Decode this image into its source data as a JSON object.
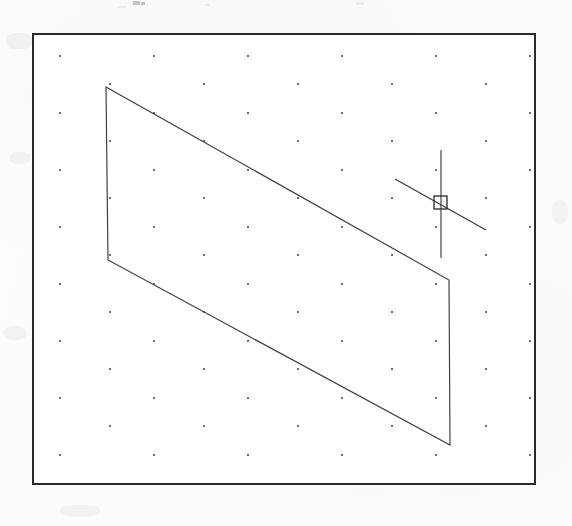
{
  "document": {
    "kind": "scanned-figure",
    "medium": "printed page scan",
    "paper_color": "#fdfdfb",
    "width": 572,
    "height": 526
  },
  "artifacts": {
    "description": "faint remnants of cropped text at the top edge of the scan",
    "marks": [
      {
        "x": 133,
        "y": 1,
        "w": 7,
        "h": 4,
        "soft": false
      },
      {
        "x": 141,
        "y": 2,
        "w": 4,
        "h": 3,
        "soft": false
      },
      {
        "x": 356,
        "y": 2,
        "w": 8,
        "h": 3,
        "soft": true
      },
      {
        "x": 117,
        "y": 6,
        "w": 10,
        "h": 2,
        "soft": true
      },
      {
        "x": 205,
        "y": 4,
        "w": 5,
        "h": 2,
        "soft": true
      }
    ],
    "smudges": [
      {
        "x": 6,
        "y": 33,
        "w": 26,
        "h": 16
      },
      {
        "x": 10,
        "y": 152,
        "w": 20,
        "h": 12
      },
      {
        "x": 4,
        "y": 326,
        "w": 22,
        "h": 14
      },
      {
        "x": 44,
        "y": 62,
        "w": 18,
        "h": 20
      },
      {
        "x": 552,
        "y": 200,
        "w": 16,
        "h": 24
      },
      {
        "x": 60,
        "y": 505,
        "w": 40,
        "h": 12
      }
    ]
  },
  "panel": {
    "name": "CAD drawing area",
    "x": 32,
    "y": 33,
    "width": 504,
    "height": 452,
    "background": "#ffffff",
    "border_color": "#2a2a2a",
    "border_width": 2,
    "shadow": {
      "color": "#9d9d9d",
      "offset_x": 11,
      "offset_y": 12
    }
  },
  "grid": {
    "style": "isometric snap dots, two interleaved lattices",
    "dot_color": "#3d3d3d",
    "dot_radius": 1.0,
    "lattices": [
      {
        "name": "primary",
        "origin_x": 26,
        "origin_y": 21,
        "spacing_x": 94,
        "spacing_y": 57,
        "cols": 6,
        "rows": 9
      },
      {
        "name": "offset",
        "origin_x": 76,
        "origin_y": 49,
        "spacing_x": 94,
        "spacing_y": 57,
        "cols": 6,
        "rows": 9
      }
    ]
  },
  "geometry": {
    "shapes": [
      {
        "name": "isometric-parallelogram-face",
        "type": "polygon",
        "closed": true,
        "stroke_color": "#3b3b3b",
        "stroke_width": 1.15,
        "vertices": [
          {
            "x": 72,
            "y": 52,
            "label": "top-left"
          },
          {
            "x": 415,
            "y": 245,
            "label": "top-right"
          },
          {
            "x": 416,
            "y": 410,
            "label": "bottom-right"
          },
          {
            "x": 74,
            "y": 225,
            "label": "bottom-left"
          }
        ]
      }
    ]
  },
  "cursor": {
    "name": "crosshair-pick-cursor",
    "color": "#333333",
    "center": {
      "x": 406,
      "y": 167
    },
    "vertical_line": {
      "x": 407,
      "y1": 115,
      "y2": 223
    },
    "axis_line": {
      "x1": 361,
      "y1": 144,
      "x2": 452,
      "y2": 195
    },
    "pickbox": {
      "x": 400,
      "y": 161,
      "size": 13
    }
  },
  "labels": {
    "panel_title": "",
    "caption": ""
  }
}
